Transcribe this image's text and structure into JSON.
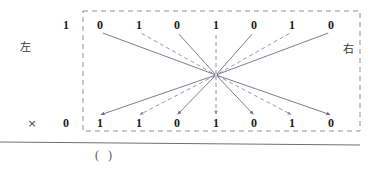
{
  "figure": {
    "caption": "(    )",
    "left_label": "左",
    "right_label": "右",
    "top_axis_value": "1",
    "bottom_axis_value": "0",
    "multiply_symbol": "×",
    "box": {
      "x": 83,
      "y": 11,
      "width": 277,
      "height": 120,
      "stroke": "#8f8fa8",
      "style": "dashed"
    },
    "hub": {
      "x": 216,
      "y": 75
    },
    "baseline_rule": {
      "y": 142,
      "stroke": "#6f6f6f"
    }
  },
  "chart_data": {
    "type": "diagram",
    "title": "",
    "top_row": {
      "label": "1",
      "values": [
        "0",
        "1",
        "0",
        "1",
        "0",
        "1",
        "0"
      ],
      "x_positions": [
        100,
        139,
        177,
        216,
        254,
        292,
        331
      ],
      "y": 25
    },
    "bottom_row": {
      "label": "0",
      "values": [
        "1",
        "1",
        "0",
        "1",
        "0",
        "1",
        "0"
      ],
      "x_positions": [
        100,
        139,
        177,
        216,
        254,
        292,
        331
      ],
      "y": 123
    },
    "edges_in": [
      {
        "from_index": 0,
        "value": "0",
        "style": "solid",
        "stroke": "#6e6e86"
      },
      {
        "from_index": 1,
        "value": "1",
        "style": "dashed",
        "stroke": "#8d8da5"
      },
      {
        "from_index": 2,
        "value": "0",
        "style": "solid",
        "stroke": "#6e6e86"
      },
      {
        "from_index": 3,
        "value": "1",
        "style": "dashed",
        "stroke": "#8d8da5"
      },
      {
        "from_index": 4,
        "value": "0",
        "style": "solid",
        "stroke": "#6e6e86"
      },
      {
        "from_index": 5,
        "value": "1",
        "style": "dashed",
        "stroke": "#8d8da5"
      },
      {
        "from_index": 6,
        "value": "0",
        "style": "solid",
        "stroke": "#6e6e86"
      }
    ],
    "edges_out": [
      {
        "to_index": 0,
        "value": "1",
        "style": "solid",
        "stroke": "#6e6e86",
        "arrow": true
      },
      {
        "to_index": 1,
        "value": "1",
        "style": "dashed",
        "stroke": "#8d8da5",
        "arrow": true
      },
      {
        "to_index": 2,
        "value": "0",
        "style": "solid",
        "stroke": "#6e6e86",
        "arrow": true
      },
      {
        "to_index": 3,
        "value": "1",
        "style": "dashed",
        "stroke": "#8d8da5",
        "arrow": true
      },
      {
        "to_index": 4,
        "value": "0",
        "style": "solid",
        "stroke": "#6e6e86",
        "arrow": true
      },
      {
        "to_index": 5,
        "value": "1",
        "style": "dashed",
        "stroke": "#8d8da5",
        "arrow": true
      },
      {
        "to_index": 6,
        "value": "0",
        "style": "solid",
        "stroke": "#6e6e86",
        "arrow": true
      }
    ],
    "legend": [],
    "grid": false
  }
}
